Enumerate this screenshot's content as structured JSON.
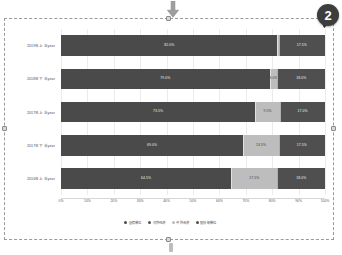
{
  "annotations": {
    "top_arrow_icon": "arrow-down-icon",
    "callout_number": "2",
    "bottom_handle_icon": "drag-handle-icon"
  },
  "chart_data": {
    "type": "bar",
    "orientation": "horizontal",
    "stacked": "100%",
    "title": "",
    "xlabel": "",
    "ylabel": "",
    "grid": true,
    "legend_position": "bottom",
    "xlim": [
      0,
      100
    ],
    "xticks": [
      "0%",
      "10%",
      "20%",
      "30%",
      "40%",
      "50%",
      "60%",
      "70%",
      "80%",
      "90%",
      "100%"
    ],
    "categories": [
      "2019年上半year",
      "2018年下半year",
      "2017年上半year",
      "2017年下半year",
      "2016年上半year"
    ],
    "series": [
      {
        "name": "国有单位",
        "color": "#4a4a4a",
        "values": [
          82.0,
          79.0,
          73.5,
          69.0,
          64.5
        ],
        "labels": [
          "82.0%",
          "79.0%",
          "73.5%",
          "69.0%",
          "64.5%"
        ]
      },
      {
        "name": "对外经济",
        "color": "#565656",
        "values": [
          0.0,
          0.0,
          0.0,
          0.0,
          0.0
        ],
        "labels": [
          "",
          "",
          "",
          "",
          ""
        ]
      },
      {
        "name": "中外合资",
        "color": "#bdbdbd",
        "values": [
          0.5,
          3.0,
          9.5,
          13.5,
          17.5
        ],
        "labels": [
          "",
          "3.0%",
          "9.5%",
          "13.5%",
          "17.5%"
        ]
      },
      {
        "name": "股份制单位",
        "color": "#4f4f4f",
        "values": [
          17.5,
          18.0,
          17.0,
          17.5,
          18.0
        ],
        "labels": [
          "17.5%",
          "18.0%",
          "17.0%",
          "17.5%",
          "18.0%"
        ]
      }
    ]
  }
}
